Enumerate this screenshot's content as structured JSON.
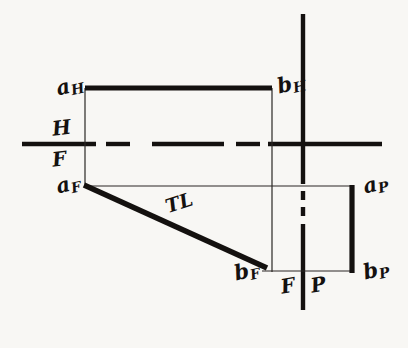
{
  "figure": {
    "kind": "orthographic-projection-drawing",
    "width": 408,
    "height": 348,
    "background_color": "#f8f7f4",
    "ink_color": "#14110f"
  },
  "labels": {
    "a_h": {
      "base": "a",
      "sub": "H"
    },
    "b_h": {
      "base": "b",
      "sub": "H"
    },
    "a_f": {
      "base": "a",
      "sub": "F"
    },
    "b_f": {
      "base": "b",
      "sub": "F"
    },
    "a_p": {
      "base": "a",
      "sub": "P"
    },
    "b_p": {
      "base": "b",
      "sub": "P"
    },
    "plane_h": "H",
    "plane_f_left": "F",
    "plane_f_right": "F",
    "plane_p": "P",
    "true_length": "TL"
  },
  "geometry": {
    "fold_line_hf": {
      "name": "H/F fold line",
      "orientation": "horizontal",
      "y": 144,
      "x_start": 22,
      "x_end": 382,
      "style": "chain-dash"
    },
    "fold_line_fp": {
      "name": "F/P fold line",
      "orientation": "vertical",
      "x": 303,
      "y_start": 14,
      "y_end": 310,
      "style": "solid-with-dashed-midsection",
      "dash_y_start": 185,
      "dash_y_end": 228
    },
    "top_view_line": {
      "name": "a_H b_H top view of line AB",
      "x1": 85,
      "y1": 88,
      "x2": 272,
      "y2": 88,
      "weight": "thick"
    },
    "front_view_line": {
      "name": "a_F b_F front view true length",
      "x1": 85,
      "y1": 186,
      "x2": 266,
      "y2": 268,
      "weight": "thick"
    },
    "profile_view_line": {
      "name": "a_P b_P profile view of line AB",
      "x1": 352,
      "y1": 186,
      "x2": 352,
      "y2": 272,
      "weight": "thick"
    },
    "projectors": [
      {
        "name": "projector-a-vertical",
        "x1": 85,
        "y1": 88,
        "x2": 85,
        "y2": 188
      },
      {
        "name": "projector-b-vertical",
        "x1": 272,
        "y1": 88,
        "x2": 272,
        "y2": 271
      },
      {
        "name": "projector-a-horizontal",
        "x1": 85,
        "y1": 186,
        "x2": 352,
        "y2": 186
      },
      {
        "name": "projector-b-horizontal",
        "x1": 263,
        "y1": 271,
        "x2": 352,
        "y2": 271
      }
    ]
  },
  "caption": {
    "visible_text": "",
    "note": "cut off at bottom edge"
  }
}
